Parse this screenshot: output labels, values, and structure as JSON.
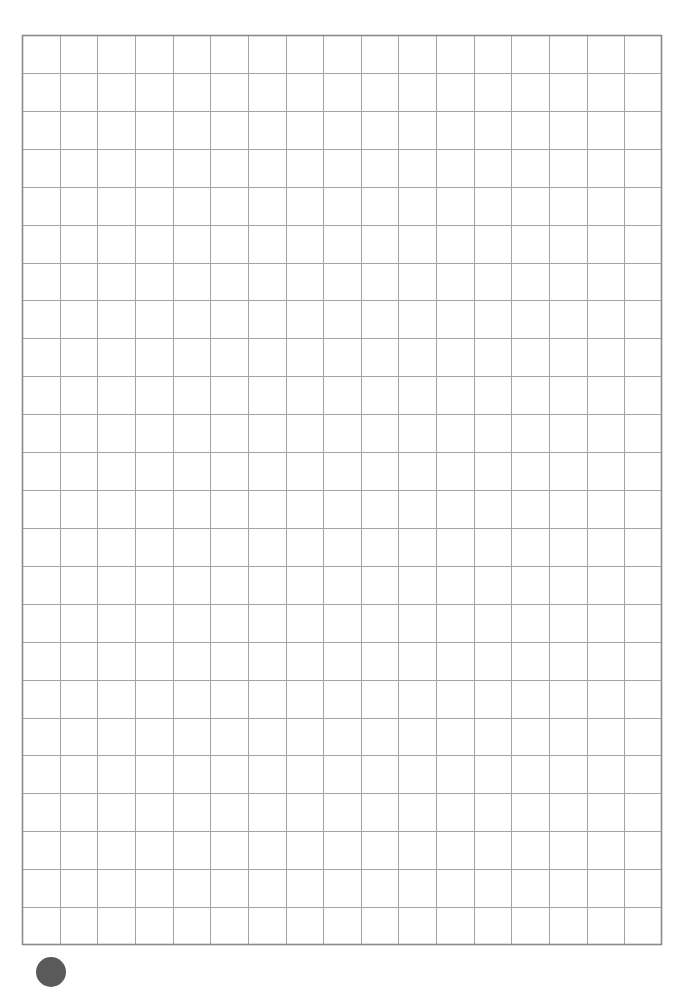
{
  "page": {
    "type": "grid-paper",
    "background_color": "#ffffff"
  },
  "grid": {
    "columns": 17,
    "rows": 24,
    "left": 22,
    "top": 35,
    "width": 640,
    "height": 910,
    "border_color": "#8a8a8a",
    "line_color": "#a3a3a3",
    "border_width": 1.6,
    "line_width": 1
  },
  "marker": {
    "shape": "circle",
    "color": "#5a5a5a",
    "position": "bottom-left"
  }
}
